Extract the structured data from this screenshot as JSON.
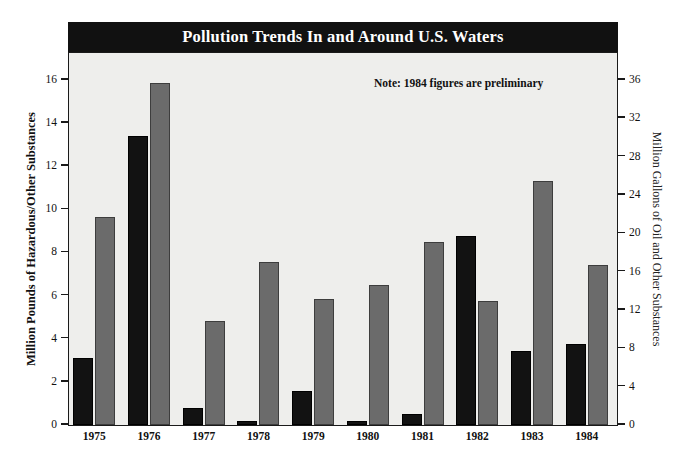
{
  "chart_data": {
    "type": "bar",
    "title": "Pollution Trends In and Around U.S. Waters",
    "annotation": "Note: 1984 figures are preliminary",
    "xlabel": "",
    "categories": [
      "1975",
      "1976",
      "1977",
      "1978",
      "1979",
      "1980",
      "1981",
      "1982",
      "1983",
      "1984"
    ],
    "series": [
      {
        "name": "Million Pounds of Hazardous/Other Substances",
        "axis": "left",
        "color": "#121212",
        "values": [
          3.1,
          13.4,
          0.8,
          0.2,
          1.6,
          0.2,
          0.5,
          8.75,
          3.45,
          3.75
        ]
      },
      {
        "name": "Million Gallons of Oil and Other Substances",
        "axis": "right",
        "color": "#6b6b6b",
        "values": [
          21.7,
          35.7,
          10.9,
          17.0,
          13.1,
          14.6,
          19.1,
          12.9,
          25.5,
          16.7
        ]
      }
    ],
    "left_axis": {
      "label": "Million Pounds of Hazardous/Other Substances",
      "ylim": [
        0,
        17.2
      ],
      "ticks": [
        0,
        2,
        4,
        6,
        8,
        10,
        12,
        14,
        16
      ]
    },
    "right_axis": {
      "label": "Million Gallons of Oil and Other Substances",
      "ylim": [
        0,
        38.7
      ],
      "ticks": [
        0,
        4,
        8,
        12,
        16,
        20,
        24,
        28,
        32,
        36
      ]
    },
    "grid": false,
    "legend": "none",
    "plot_background": "#eeeeec",
    "title_background": "#111111",
    "title_color": "#ffffff"
  }
}
